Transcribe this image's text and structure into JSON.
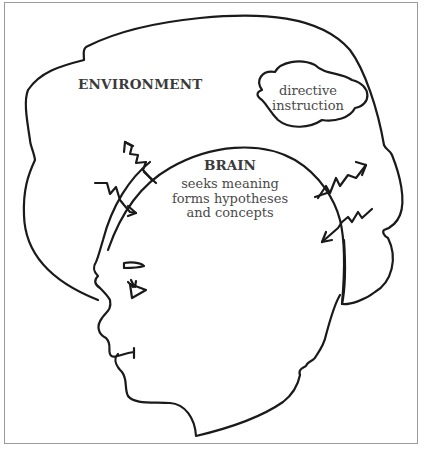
{
  "diagram": {
    "type": "illustration",
    "environment": {
      "label": "ENVIRONMENT"
    },
    "directive_cloud": {
      "lines": [
        "directive",
        "instruction"
      ]
    },
    "brain": {
      "label": "BRAIN",
      "lines": [
        "seeks meaning",
        "forms hypotheses",
        "and concepts"
      ]
    },
    "arrows": [
      {
        "id": "arrow-out-upper-left",
        "direction": "outward"
      },
      {
        "id": "arrow-in-left",
        "direction": "inward"
      },
      {
        "id": "arrow-out-right",
        "direction": "outward"
      },
      {
        "id": "arrow-in-right",
        "direction": "inward"
      }
    ],
    "colors": {
      "stroke": "#1a1a1a",
      "text": "#3a3a3a",
      "frame": "#9a9a9a",
      "background": "#ffffff"
    }
  }
}
